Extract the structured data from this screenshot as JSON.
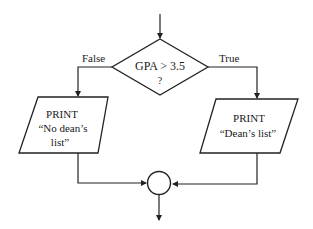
{
  "flowchart": {
    "decision": {
      "line1": "GPA > 3.5",
      "line2": "?"
    },
    "branches": {
      "false_label": "False",
      "true_label": "True"
    },
    "false_output": {
      "line1": "PRINT",
      "line2": "“No dean’s",
      "line3": "list”"
    },
    "true_output": {
      "line1": "PRINT",
      "line2": "“Dean’s list”"
    },
    "connector": "merge-connector"
  },
  "colors": {
    "stroke": "#222222",
    "background": "#ffffff"
  }
}
